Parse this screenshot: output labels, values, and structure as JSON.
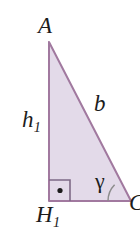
{
  "figure": {
    "name": "right-triangle-diagram",
    "background_color": "#ffffff",
    "fill_color": "#e3dae9",
    "stroke_color": "#a1799f",
    "arc_color": "#8c8c8c",
    "text_color": "#1c1c1c",
    "vertices": {
      "A": {
        "x": 49,
        "y": 42
      },
      "H1": {
        "x": 49,
        "y": 201
      },
      "C": {
        "x": 131,
        "y": 201
      }
    },
    "labels": {
      "apex": "A",
      "height": "h",
      "height_subscript": "1",
      "hypotenuse": "b",
      "angle": "γ",
      "foot": "H",
      "foot_subscript": "1",
      "right_vertex": "C"
    },
    "markers": {
      "right_angle_square_size": "22",
      "right_angle_dot": true,
      "angle_arc_radius": "23"
    }
  }
}
